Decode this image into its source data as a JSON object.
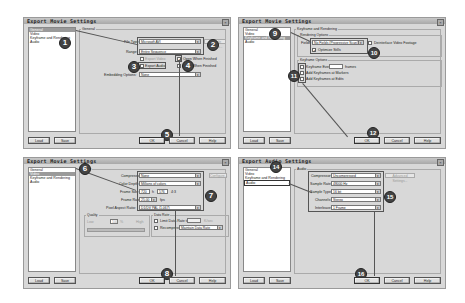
{
  "dialogs": [
    {
      "title": "Export Movie Settings",
      "nav": [
        "General",
        "Video",
        "Keyframe and Rendering",
        "Audio"
      ],
      "selected_nav": 0,
      "panel_label": "General",
      "fields": {
        "file_type_label": "File Type:",
        "file_type_value": "Microsoft AVI",
        "range_label": "Range:",
        "range_value": "Entire Sequence",
        "export_video_label": "Export Video",
        "export_audio_label": "Export Audio",
        "open_when_finished_label": "Open When Finished",
        "beep_when_finished_label": "Beep When Finished",
        "embedding_label": "Embedding Options:",
        "embedding_value": "None",
        "compile_settings_label": "Compile Settings..."
      },
      "badges": [
        "1",
        "2",
        "3",
        "4",
        "5"
      ],
      "buttons": {
        "load": "Load",
        "save": "Save",
        "ok": "OK",
        "cancel": "Cancel",
        "help": "Help"
      }
    },
    {
      "title": "Export Movie Settings",
      "nav": [
        "General",
        "Video",
        "Keyframe and Rendering",
        "Audio"
      ],
      "selected_nav": 2,
      "panel_label": "Keyframe and Rendering",
      "fields": {
        "rendering_group": "Rendering Options",
        "fields_label": "Fields:",
        "fields_value": "No Fields (Progressive Scan)",
        "deinterlace_label": "Deinterlace Video Footage",
        "optimize_stills_label": "Optimize Stills",
        "keyframe_group": "Keyframe Options",
        "keyframe_every_label": "Keyframe Every",
        "keyframe_every_value": "",
        "frames_label": "frames",
        "add_keyframes_markers_label": "Add Keyframes at Markers",
        "add_keyframes_edits_label": "Add Keyframes at Edits"
      },
      "badges": [
        "9",
        "10",
        "11",
        "12"
      ],
      "buttons": {
        "load": "Load",
        "save": "Save",
        "ok": "OK",
        "cancel": "Cancel",
        "help": "Help"
      }
    },
    {
      "title": "Export Movie Settings",
      "nav": [
        "General",
        "Video",
        "Keyframe and Rendering",
        "Audio"
      ],
      "selected_nav": 1,
      "panel_label": "Video",
      "fields": {
        "compressor_label": "Compressor:",
        "compressor_value": "None",
        "configure_label": "Configure...",
        "color_depth_label": "Color Depth:",
        "color_depth_value": "Millions of colors",
        "frame_size_label": "Frame Size:",
        "frame_w": "720",
        "frame_h_label": "h",
        "frame_h": "576",
        "aspect": "4:3",
        "frame_rate_label": "Frame Rate:",
        "frame_rate_value": "25.00",
        "fps_label": "fps",
        "par_label": "Pixel Aspect Ratio:",
        "par_value": "D1/DV PAL (1.067)",
        "quality_group": "Quality",
        "quality_low": "Low",
        "quality_value": "100",
        "quality_pct": "%",
        "quality_high": "High",
        "data_rate_group": "Data Rate",
        "limit_data_rate_label": "Limit Data Rate to",
        "limit_unit": "K/sec",
        "recompress_label": "Recompress",
        "recompress_value": "Maintain Data Rate"
      },
      "badges": [
        "6",
        "7",
        "8"
      ],
      "buttons": {
        "load": "Load",
        "save": "Save",
        "ok": "OK",
        "cancel": "Cancel",
        "help": "Help"
      }
    },
    {
      "title": "Export Audio Settings",
      "nav": [
        "General",
        "Video",
        "Keyframe and Rendering",
        "Audio"
      ],
      "selected_nav": 3,
      "panel_label": "Audio",
      "fields": {
        "compressor_label": "Compressor:",
        "compressor_value": "Uncompressed",
        "advanced_label": "Advanced Settings...",
        "sample_rate_label": "Sample Rate:",
        "sample_rate_value": "48000 Hz",
        "sample_type_label": "Sample Type:",
        "sample_type_value": "16 bit",
        "channels_label": "Channels:",
        "channels_value": "Stereo",
        "interleave_label": "Interleave:",
        "interleave_value": "1 Frame"
      },
      "badges": [
        "14",
        "15",
        "16"
      ],
      "buttons": {
        "load": "Load",
        "save": "Save",
        "ok": "OK",
        "cancel": "Cancel",
        "help": "Help"
      }
    }
  ],
  "colors": {
    "dialog_bg": "#d8d8d8",
    "titlebar": "#b0b0b0",
    "badge": "#444444",
    "annotation": "#555555"
  }
}
